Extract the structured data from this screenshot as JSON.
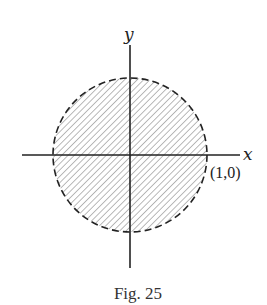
{
  "figure": {
    "caption": "Fig. 25",
    "x_axis_label": "x",
    "y_axis_label": "y",
    "point_label": "(1,0)",
    "region": {
      "shape": "disk",
      "boundary": "dashed",
      "fill": "hatched",
      "center": [
        0,
        0
      ],
      "radius": 1
    },
    "colors": {
      "ink": "#222222",
      "hatch": "#555555",
      "background": "#ffffff"
    }
  }
}
